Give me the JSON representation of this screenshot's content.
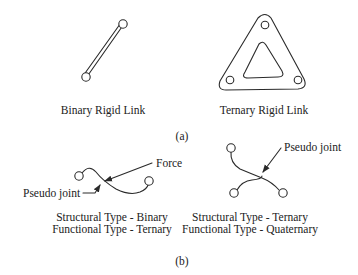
{
  "figure": {
    "part_a": {
      "label": "(a)",
      "binary_link": {
        "caption": "Binary Rigid Link"
      },
      "ternary_link": {
        "caption": "Ternary Rigid Link"
      }
    },
    "part_b": {
      "label": "(b)",
      "left": {
        "annotations": {
          "force": "Force",
          "pseudo_joint": "Pseudo joint"
        },
        "caption_line1": "Structural Type - Binary",
        "caption_line2": "Functional Type - Ternary"
      },
      "right": {
        "annotations": {
          "pseudo_joint": "Pseudo joint"
        },
        "caption_line1": "Structural Type - Ternary",
        "caption_line2": "Functional Type - Quaternary"
      }
    }
  }
}
